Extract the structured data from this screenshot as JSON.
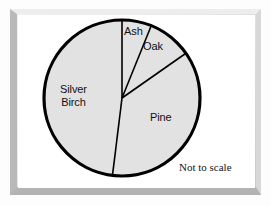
{
  "figure": {
    "note": "Not to scale",
    "background_color": "#ffffff",
    "frame_color": "#c9c9c9"
  },
  "chart_data": {
    "type": "pie",
    "title": "",
    "subtitle": "",
    "xlabel": "",
    "ylabel": "",
    "annotations": [
      "Not to scale"
    ],
    "legend": "none",
    "grid": false,
    "labels_inside": true,
    "slice_fill_color": "#e2e2e2",
    "slice_outline_color": "#000000",
    "center": {
      "x": 122,
      "y": 98
    },
    "radius": 78,
    "start_angle_deg": 0,
    "direction": "clockwise",
    "categories": [
      "Ash",
      "Oak",
      "Pine",
      "Silver Birch"
    ],
    "values": [
      6,
      9,
      37,
      48
    ],
    "units": "percent",
    "slices": [
      {
        "label": "Ash",
        "value": 6,
        "start_deg": 0,
        "end_deg": 22,
        "sweep_deg": 22
      },
      {
        "label": "Oak",
        "value": 9,
        "start_deg": 22,
        "end_deg": 55,
        "sweep_deg": 33
      },
      {
        "label": "Pine",
        "value": 37,
        "start_deg": 55,
        "end_deg": 187,
        "sweep_deg": 132
      },
      {
        "label": "Silver Birch",
        "value": 48,
        "start_deg": 187,
        "end_deg": 360,
        "sweep_deg": 173
      }
    ],
    "label_text": {
      "ash": "Ash",
      "oak": "Oak",
      "pine": "Pine",
      "silver_birch_line1": "Silver",
      "silver_birch_line2": "Birch"
    }
  }
}
